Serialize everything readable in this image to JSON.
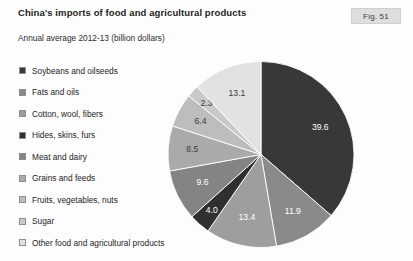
{
  "header": {
    "title": "China's imports of food and agricultural products",
    "subtitle": "Annual average 2012-13 (billion dollars)",
    "fig_label": "Fig. 51"
  },
  "legend": {
    "items": [
      {
        "label": "Soybeans and oilseeds",
        "color": "#383838"
      },
      {
        "label": "Fats and oils",
        "color": "#8a8a8a"
      },
      {
        "label": "Cotton, wool, fibers",
        "color": "#9e9e9e"
      },
      {
        "label": "Hides, skins, furs",
        "color": "#303030"
      },
      {
        "label": "Meat and dairy",
        "color": "#848484"
      },
      {
        "label": "Grains and feeds",
        "color": "#aaaaaa"
      },
      {
        "label": "Fruits, vegetables, nuts",
        "color": "#bdbdbd"
      },
      {
        "label": "Sugar",
        "color": "#c9c9c9"
      },
      {
        "label": "Other food and agricultural products",
        "color": "#e2e2e2"
      }
    ]
  },
  "chart_data": {
    "type": "pie",
    "title": "China's imports of food and agricultural products",
    "subtitle": "Annual average 2012-13 (billion dollars)",
    "unit": "billion dollars",
    "total": 108.8,
    "legend_position": "left",
    "start_angle_deg": 0,
    "direction": "clockwise",
    "categories": [
      "Soybeans and oilseeds",
      "Fats and oils",
      "Cotton, wool, fibers",
      "Hides, skins, furs",
      "Meat and dairy",
      "Grains and feeds",
      "Fruits, vegetables, nuts",
      "Sugar",
      "Other food and agricultural products"
    ],
    "values": [
      39.6,
      11.9,
      13.4,
      4.0,
      9.6,
      8.5,
      6.4,
      2.3,
      13.1
    ],
    "labels": [
      "39.6",
      "11.9",
      "13.4",
      "4.0",
      "9.6",
      "8.5",
      "6.4",
      "2.3",
      "13.1"
    ],
    "colors": [
      "#383838",
      "#8a8a8a",
      "#9e9e9e",
      "#303030",
      "#848484",
      "#aaaaaa",
      "#bdbdbd",
      "#c9c9c9",
      "#e2e2e2"
    ],
    "label_colors": [
      "#ffffff",
      "#ffffff",
      "#ffffff",
      "#ffffff",
      "#ffffff",
      "#3a3a3a",
      "#3a3a3a",
      "#3a3a3a",
      "#3a3a3a"
    ]
  }
}
